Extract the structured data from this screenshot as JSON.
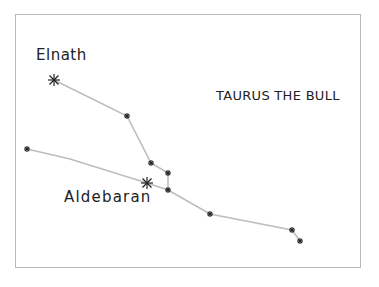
{
  "diagram": {
    "title": "TAURUS THE BULL",
    "labels": {
      "elnath": "Elnath",
      "aldebaran": "Aldebaran"
    },
    "colors": {
      "line": "#bdbdbd",
      "star": "#222222",
      "frame": "#b8b8b8"
    },
    "stars": [
      {
        "name": "Elnath",
        "x": 54,
        "y": 80,
        "size": "large"
      },
      {
        "name": "",
        "x": 127,
        "y": 116,
        "size": "small"
      },
      {
        "name": "",
        "x": 151,
        "y": 163,
        "size": "small"
      },
      {
        "name": "",
        "x": 168,
        "y": 173,
        "size": "small"
      },
      {
        "name": "",
        "x": 168,
        "y": 190,
        "size": "small"
      },
      {
        "name": "Aldebaran",
        "x": 147,
        "y": 183,
        "size": "large"
      },
      {
        "name": "",
        "x": 27,
        "y": 149,
        "size": "small"
      },
      {
        "name": "",
        "x": 210,
        "y": 214,
        "size": "small"
      },
      {
        "name": "",
        "x": 292,
        "y": 230,
        "size": "small"
      },
      {
        "name": "",
        "x": 300,
        "y": 241,
        "size": "small"
      }
    ]
  }
}
